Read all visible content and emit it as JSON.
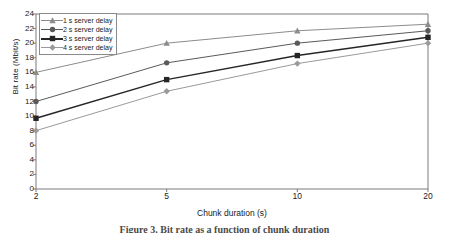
{
  "chart_data": {
    "type": "line",
    "title": "",
    "xlabel": "Chunk duration (s)",
    "ylabel": "Bit rate (Mbit/s)",
    "categories": [
      "2",
      "5",
      "10",
      "20"
    ],
    "x_tick_labels": [
      "2",
      "5",
      "10",
      "20"
    ],
    "y_tick_labels": [
      "0",
      "2",
      "4",
      "6",
      "8",
      "10",
      "12",
      "14",
      "16",
      "18",
      "20",
      "22",
      "24"
    ],
    "ylim": [
      0,
      24
    ],
    "y_tick_step": 2,
    "grid": false,
    "legend_position": "top-left",
    "series": [
      {
        "name": "1 s server delay",
        "marker": "triangle-up",
        "color": "#8c8c8c",
        "values": [
          16.0,
          20.0,
          21.7,
          22.6
        ]
      },
      {
        "name": "2 s server delay",
        "marker": "circle",
        "color": "#5a5a5a",
        "values": [
          12.0,
          17.3,
          20.0,
          21.7
        ]
      },
      {
        "name": "3 s server delay",
        "marker": "square",
        "color": "#262626",
        "values": [
          9.7,
          15.0,
          18.3,
          20.8
        ]
      },
      {
        "name": "4 s server delay",
        "marker": "diamond",
        "color": "#9a9a9a",
        "values": [
          8.0,
          13.4,
          17.2,
          20.0
        ]
      }
    ]
  },
  "caption": "Figure 3. Bit rate as a function of chunk duration",
  "axis_color": "#7a7a7a",
  "legend_border_color": "#8a8a8a"
}
